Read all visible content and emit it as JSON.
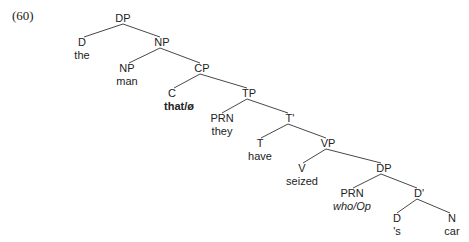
{
  "example_number": "(60)",
  "tree": {
    "root": {
      "label": "DP",
      "x": 123,
      "y": 18
    },
    "nodes": [
      {
        "id": "d1",
        "label": "D",
        "word": "the",
        "x": 82,
        "y": 42
      },
      {
        "id": "np1",
        "label": "NP",
        "x": 163,
        "y": 42
      },
      {
        "id": "np2",
        "label": "NP",
        "word": "man",
        "x": 127,
        "y": 68
      },
      {
        "id": "cp",
        "label": "CP",
        "x": 203,
        "y": 68
      },
      {
        "id": "c",
        "label": "C",
        "word": "that/ø",
        "x": 175,
        "y": 93
      },
      {
        "id": "tp",
        "label": "TP",
        "x": 250,
        "y": 93
      },
      {
        "id": "prn1",
        "label": "PRN",
        "word": "they",
        "x": 222,
        "y": 118
      },
      {
        "id": "tbar",
        "label": "T'",
        "x": 290,
        "y": 118
      },
      {
        "id": "t",
        "label": "T",
        "word": "have",
        "x": 260,
        "y": 143
      },
      {
        "id": "vp",
        "label": "VP",
        "x": 329,
        "y": 143
      },
      {
        "id": "v",
        "label": "V",
        "word": "seized",
        "x": 302,
        "y": 168
      },
      {
        "id": "dp2",
        "label": "DP",
        "x": 384,
        "y": 168
      },
      {
        "id": "prn2",
        "label": "PRN",
        "word": "who/Op",
        "x": 352,
        "y": 193
      },
      {
        "id": "dbar",
        "label": "D'",
        "x": 419,
        "y": 193
      },
      {
        "id": "d2",
        "label": "D",
        "word": "'s",
        "x": 397,
        "y": 218
      },
      {
        "id": "n",
        "label": "N",
        "word": "car",
        "x": 452,
        "y": 218
      }
    ]
  },
  "labels": {
    "ex": "(60)",
    "dp_root": "DP",
    "d1": "D",
    "the": "the",
    "np1": "NP",
    "np2": "NP",
    "man": "man",
    "cp": "CP",
    "c": "C",
    "that": "that/ø",
    "tp": "TP",
    "prn1": "PRN",
    "they": "they",
    "tbar": "T'",
    "t": "T",
    "have": "have",
    "vp": "VP",
    "v": "V",
    "seized": "seized",
    "dp2": "DP",
    "prn2": "PRN",
    "who": "who/Op",
    "dbar": "D'",
    "d2": "D",
    "s": "'s",
    "n": "N",
    "car": "car"
  }
}
